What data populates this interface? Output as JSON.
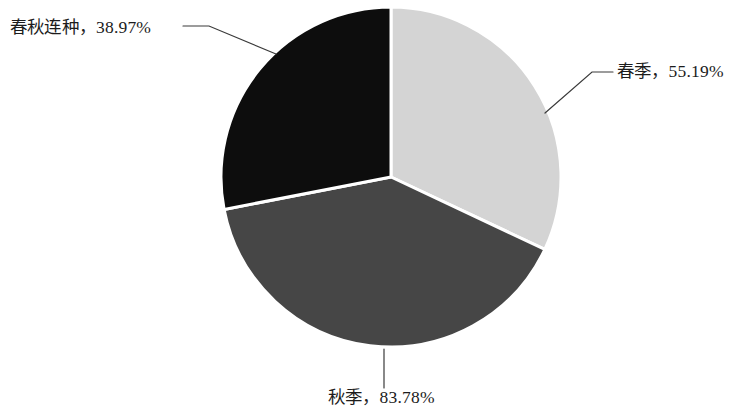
{
  "chart_data": {
    "type": "pie",
    "title": "",
    "subtitle": "",
    "xlabel": "",
    "ylabel": "",
    "legend_position": "none",
    "grid": false,
    "labels_outside": true,
    "categories": [
      "春季",
      "秋季",
      "春秋连种"
    ],
    "values": [
      55.19,
      83.78,
      38.97
    ],
    "value_suffix": "%",
    "slices": [
      {
        "name": "春季",
        "value": 55.19,
        "value_text": "55.19%",
        "label_text": "春季，55.19%",
        "color": "#d4d4d4",
        "start_angle_deg": 0,
        "end_angle_deg": 115.2,
        "leader_side": "right"
      },
      {
        "name": "秋季",
        "value": 83.78,
        "value_text": "83.78%",
        "label_text": "秋季，83.78%",
        "color": "#464646",
        "start_angle_deg": 115.2,
        "end_angle_deg": 259.0,
        "leader_side": "bottom"
      },
      {
        "name": "春秋连种",
        "value": 38.97,
        "value_text": "38.97%",
        "label_text": "春秋连种，38.97%",
        "color": "#0d0d0d",
        "start_angle_deg": 259.0,
        "end_angle_deg": 360,
        "leader_side": "left"
      }
    ],
    "colors": {
      "spring": "#d4d4d4",
      "autumn": "#464646",
      "spring_autumn": "#0d0d0d",
      "separator": "#ffffff",
      "leader_line": "#3a3a3a",
      "label_text": "#1c1c1c",
      "background": "#ffffff"
    },
    "geometry": {
      "center_x": 391,
      "center_y": 177,
      "radius": 170
    }
  }
}
